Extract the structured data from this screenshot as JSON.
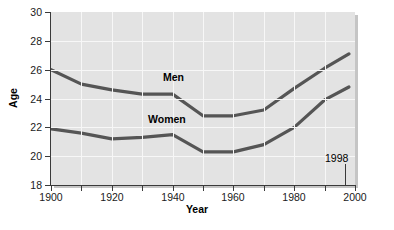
{
  "chart_data": {
    "type": "line",
    "title": "",
    "xlabel": "Year",
    "ylabel": "Age",
    "xlim": [
      1900,
      2000
    ],
    "ylim": [
      18,
      30
    ],
    "xticks": [
      1900,
      1920,
      1940,
      1960,
      1980,
      2000
    ],
    "xtick_labels": [
      "1900",
      "1920",
      "1940",
      "1960",
      "1980",
      "2000"
    ],
    "yticks": [
      18,
      20,
      22,
      24,
      26,
      28,
      30
    ],
    "ytick_labels": [
      "18",
      "20",
      "22",
      "24",
      "26",
      "28",
      "30"
    ],
    "x_minor_step": 10,
    "grid": true,
    "grid_color": "#f7f7f7",
    "plot_background": "#e3e3e3",
    "line_color": "#555555",
    "legend_position": "inline-labels",
    "annotations": [
      {
        "text": "1998",
        "x": 1998,
        "y": 19.2
      }
    ],
    "series": [
      {
        "name": "Men",
        "label": "Men",
        "x": [
          1900,
          1910,
          1920,
          1930,
          1940,
          1950,
          1960,
          1970,
          1980,
          1990,
          1998
        ],
        "values": [
          26.0,
          25.0,
          24.6,
          24.3,
          24.3,
          22.8,
          22.8,
          23.2,
          24.7,
          26.1,
          27.1
        ]
      },
      {
        "name": "Women",
        "label": "Women",
        "x": [
          1900,
          1910,
          1920,
          1930,
          1940,
          1950,
          1960,
          1970,
          1980,
          1990,
          1998
        ],
        "values": [
          21.9,
          21.6,
          21.2,
          21.3,
          21.5,
          20.3,
          20.3,
          20.8,
          22.0,
          23.9,
          24.8
        ]
      }
    ]
  }
}
